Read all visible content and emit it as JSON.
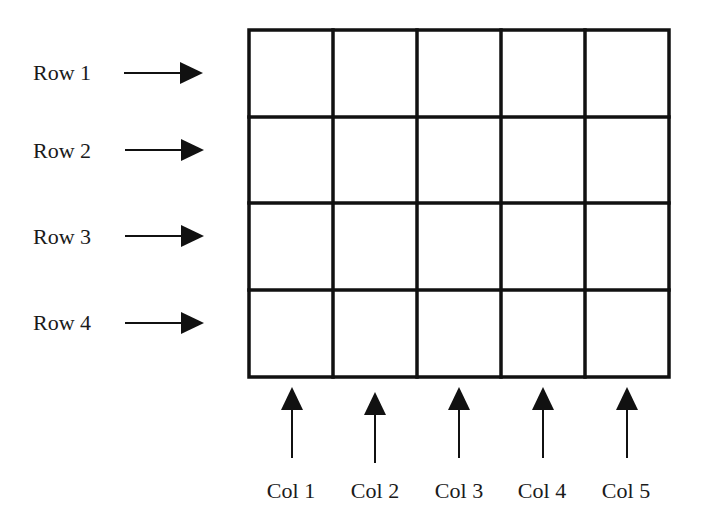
{
  "diagram": {
    "type": "grid",
    "rows": 4,
    "cols": 5,
    "row_labels": [
      "Row 1",
      "Row 2",
      "Row 3",
      "Row 4"
    ],
    "col_labels": [
      "Col 1",
      "Col 2",
      "Col 3",
      "Col 4",
      "Col 5"
    ],
    "line_color": "#111111",
    "background": "#ffffff"
  }
}
